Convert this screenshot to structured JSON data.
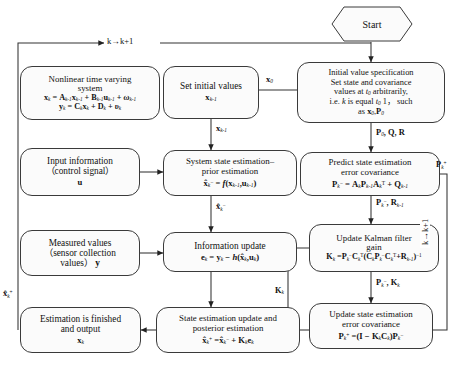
{
  "diagram": {
    "start": {
      "label": "Start",
      "shape": "hexagon"
    },
    "loop_labels": {
      "top": "k→k+1",
      "right": "k→k+1"
    },
    "nodes": {
      "nonlinear_system": {
        "line1": "Nonlinear time varying",
        "line2": "system",
        "eq1": "xₖ = Aₖ₋₁xₖ₋₁ + Bₖ₋₁uₖ₋₁ + ωₖ₋₁",
        "eq2": "yₖ = Cₖxₖ + Dₖ + υₖ"
      },
      "set_initial_values": {
        "line1": "Set initial values",
        "eq1": "xₖ₋₁"
      },
      "initial_value_spec": {
        "line1": "Initial value specification",
        "line2": "Set state and covariance",
        "line3": "values at t₀ arbitrarily,",
        "line4": "i.e. k is equal t₀ 1， such",
        "line5": "as x₀,P₀"
      },
      "input_information": {
        "line1": "Input information",
        "line2": "（control signal）",
        "eq1": "u"
      },
      "system_state_estimation": {
        "line1": "System state estimation–",
        "line2": "prior estimation",
        "eq1": "x̂ₖ⁻ = f(xₖ₋₁,uₖ₋₁)"
      },
      "predict_covariance": {
        "line1": "Predict state estimation",
        "line2": "error covariance",
        "eq1": "Pₖ⁻ = AₖPₖ₋₁Aₖᵀ + Qₖ₋₁"
      },
      "measured_values": {
        "line1": "Measured values",
        "line2": "（sensor collection",
        "line3": "values） y"
      },
      "information_update": {
        "line1": "Information update",
        "eq1": "eₖ = yₖ − h(x̂ₖ,uₖ)"
      },
      "update_kalman_gain": {
        "line1": "Update Kalman filter",
        "line2": "gain",
        "eq1": "Kₖ = Pₖ⁻Cₖᵀ(CₖPₖ⁻Cₖᵀ+Rₖ₋₁)⁻¹"
      },
      "estimation_finished": {
        "line1": "Estimation is finished",
        "line2": "and output",
        "eq1": "xₖ"
      },
      "state_update_posterior": {
        "line1": "State estimation update and",
        "line2": "posterior estimation",
        "eq1": "x̂ₖ⁺ = x̂ₖ⁻ + Kₖeₖ"
      },
      "update_covariance": {
        "line1": "Update state estimation",
        "line2": "error covariance",
        "eq1": "Pₖ⁺ = (I − KₖCₖ)Pₖ⁻"
      }
    },
    "edge_labels": {
      "spec_to_setinit": "x₀",
      "spec_to_predict": "P₀, Q, R",
      "setinit_to_sysstate": "xₖ₋₁",
      "predict_to_gain": "Pₖ⁻, Rₖ₋₁",
      "predict_feedback": "Pₖ⁺",
      "sysstate_to_infoupdate": "x̂ₖ⁻",
      "gain_to_updatecov": "Pₖ⁻, Kₖ",
      "gain_to_stateupdate": "Kₖ",
      "stateupdate_out": "x̂ₖ⁺"
    },
    "colors": {
      "stroke": "#3a3a3a",
      "fill": "#fbfbfb",
      "background": "#ffffff",
      "text": "#111111"
    }
  }
}
